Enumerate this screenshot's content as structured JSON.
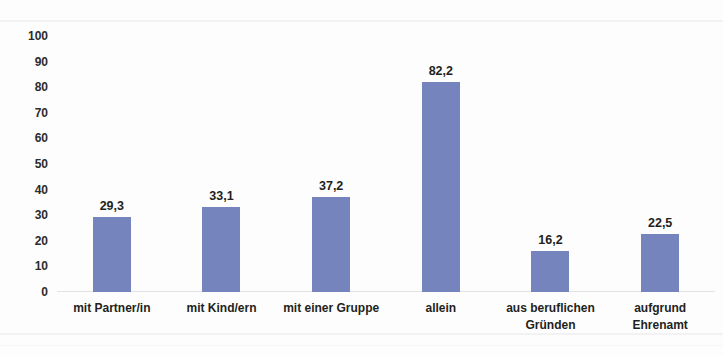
{
  "chart_data": {
    "type": "bar",
    "title": "",
    "subtitle": "",
    "xlabel": "",
    "ylabel": "",
    "categories": [
      "mit Partner/in",
      "mit Kind/ern",
      "mit einer Gruppe",
      "allein",
      "aus beruflichen Gründen",
      "aufgrund Ehrenamt"
    ],
    "category_lines": [
      [
        "mit Partner/in"
      ],
      [
        "mit Kind/ern"
      ],
      [
        "mit einer Gruppe"
      ],
      [
        "allein"
      ],
      [
        "aus beruflichen",
        "Gründen"
      ],
      [
        "aufgrund",
        "Ehrenamt"
      ]
    ],
    "values": [
      29.3,
      33.1,
      37.2,
      82.2,
      16.2,
      22.5
    ],
    "value_labels": [
      "29,3",
      "33,1",
      "37,2",
      "82,2",
      "16,2",
      "22,5"
    ],
    "ylim": [
      0,
      100
    ],
    "yticks": [
      0,
      10,
      20,
      30,
      40,
      50,
      60,
      70,
      80,
      90,
      100
    ],
    "ytick_labels": [
      "100",
      "90",
      "80",
      "70",
      "60",
      "50",
      "40",
      "30",
      "20",
      "10",
      "0"
    ],
    "grid": false,
    "legend": null,
    "legend_position": "none",
    "series": [
      {
        "name": "",
        "values": [
          29.3,
          33.1,
          37.2,
          82.2,
          16.2,
          22.5
        ]
      }
    ]
  },
  "colors": {
    "bar": "#7584bd",
    "text": "#231f20",
    "axis_line": "#e2e2e4",
    "background": "#fdfdfd"
  }
}
